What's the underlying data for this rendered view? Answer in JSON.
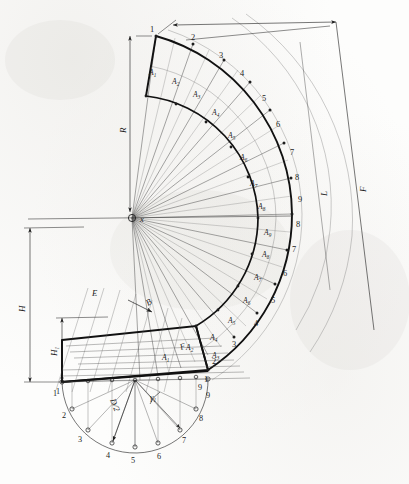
{
  "drawing": {
    "title": "Cone pattern development layout",
    "type": "technical-engineering-drawing",
    "background_color": "#fdfdfc",
    "ink_color": "#1d1d1d"
  },
  "dimensions": {
    "radius_label": "R",
    "length_label": "L",
    "overall_length_label": "F",
    "height_label": "H",
    "sub_height_label": "H",
    "sub_height_sub": "1",
    "edge_label": "E",
    "slant_label": "B",
    "face_label": "F",
    "diameter_label": "D/2",
    "angle_label": "γ",
    "angle_sub": "1",
    "center_label": "x"
  },
  "sector": {
    "outer_numbers_upper": [
      "1",
      "2",
      "3",
      "4",
      "5",
      "6",
      "7",
      "8",
      "9"
    ],
    "outer_numbers_lower": [
      "8",
      "7",
      "6",
      "5",
      "4",
      "3",
      "2",
      "1"
    ],
    "segment_labels_upper": [
      "A",
      "A",
      "A",
      "A",
      "A",
      "A",
      "A",
      "A",
      "A"
    ],
    "segment_subs_upper": [
      "1",
      "2",
      "3",
      "4",
      "5",
      "6",
      "7",
      "8",
      "9"
    ],
    "segment_labels_lower": [
      "A",
      "A",
      "A",
      "A",
      "A",
      "A",
      "A",
      "A"
    ],
    "segment_subs_lower": [
      "8",
      "7",
      "6",
      "5",
      "4",
      "3",
      "2",
      "1"
    ]
  },
  "plan_view": {
    "station_numbers": [
      "1",
      "2",
      "3",
      "4",
      "5",
      "6",
      "7",
      "8",
      "9"
    ],
    "radius_label": "D/2",
    "angle_label": "γ",
    "angle_sub": "1"
  },
  "base_view": {
    "left_number": "1",
    "right_number": "9"
  }
}
